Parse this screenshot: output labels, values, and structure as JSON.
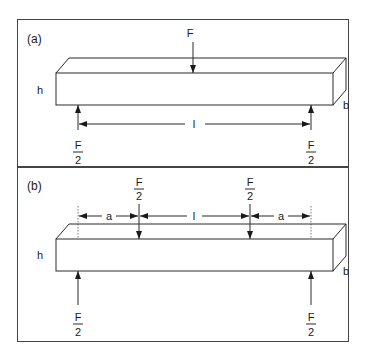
{
  "figure": {
    "panel_a": {
      "label": "(a)",
      "height_label": "h",
      "width_label": "b",
      "span_label": "l",
      "load_top": "F",
      "support_left": {
        "numerator": "F",
        "denominator": "2"
      },
      "support_right": {
        "numerator": "F",
        "denominator": "2"
      }
    },
    "panel_b": {
      "label": "(b)",
      "height_label": "h",
      "width_label": "b",
      "span_label": "l",
      "left_offset_label": "a",
      "right_offset_label": "a",
      "load_left": {
        "numerator": "F",
        "denominator": "2"
      },
      "load_right": {
        "numerator": "F",
        "denominator": "2"
      },
      "support_left": {
        "numerator": "F",
        "denominator": "2"
      },
      "support_right": {
        "numerator": "F",
        "denominator": "2"
      }
    },
    "colors": {
      "line": "#2a2a2a",
      "background": "#ffffff"
    }
  }
}
